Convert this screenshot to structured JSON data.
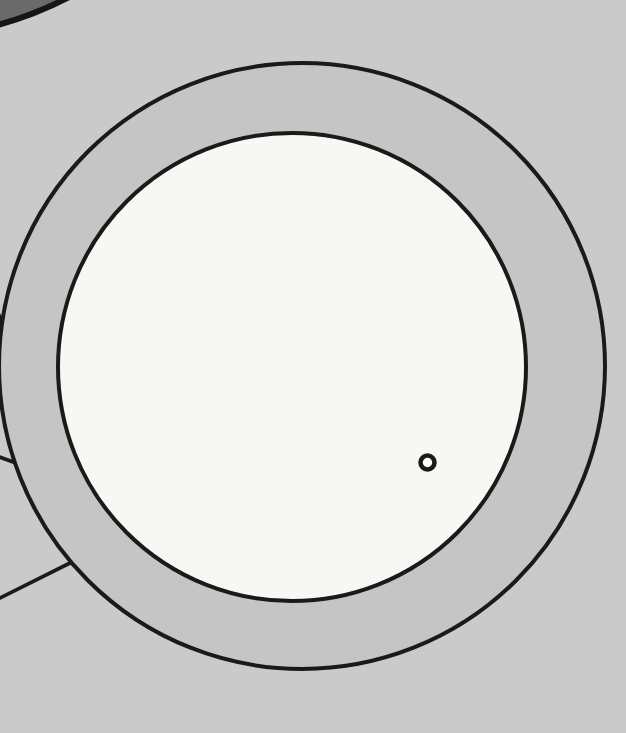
{
  "illustration": {
    "colors": {
      "background": "#cacaca",
      "ring_fill": "#c5c5c5",
      "inner_disc_fill": "#f7f7f4",
      "outline": "#1a1a1a",
      "dark_shape_fill": "#6a6a6a",
      "dark_shape_outline": "#161616",
      "small_circle_fill": "#fdfdfd"
    }
  }
}
